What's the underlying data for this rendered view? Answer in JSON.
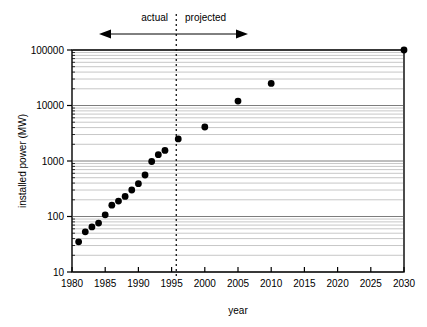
{
  "chart_data": {
    "type": "scatter",
    "title": "",
    "xlabel": "year",
    "ylabel": "installed power (MW)",
    "xlim": [
      1980,
      2030
    ],
    "ylim": [
      10,
      100000
    ],
    "yscale": "log",
    "xscale": "linear",
    "grid": "horizontal-minor-and-major",
    "legend": "none",
    "xticks": [
      "1980",
      "1985",
      "1990",
      "1995",
      "2000",
      "2005",
      "2010",
      "2015",
      "2020",
      "2025",
      "2030"
    ],
    "xtick_values": [
      1980,
      1985,
      1990,
      1995,
      2000,
      2005,
      2010,
      2015,
      2020,
      2025,
      2030
    ],
    "yticks": [
      "10",
      "100",
      "1000",
      "10000",
      "100000"
    ],
    "ytick_values": [
      10,
      100,
      1000,
      10000,
      100000
    ],
    "marker": "filled-circle",
    "marker_color": "#000000",
    "series": [
      {
        "name": "actual",
        "x": [
          1981,
          1982,
          1983,
          1984,
          1985,
          1986,
          1987,
          1988,
          1989,
          1990,
          1991,
          1992,
          1993,
          1994,
          1996
        ],
        "values": [
          35,
          53,
          65,
          76,
          107,
          160,
          190,
          230,
          300,
          390,
          560,
          980,
          1300,
          1550,
          2500
        ]
      },
      {
        "name": "projected",
        "x": [
          2000,
          2005,
          2010,
          2030
        ],
        "values": [
          4100,
          12000,
          25000,
          100000
        ]
      }
    ],
    "annotations": [
      {
        "name": "actual",
        "label": "actual",
        "side": "left"
      },
      {
        "name": "projected",
        "label": "projected",
        "side": "right"
      }
    ],
    "divider_year": 1995.7,
    "divider_style": "dotted"
  },
  "axes": {
    "y_title": "installed power (MW)",
    "x_title": "year"
  },
  "annotations": {
    "actual_label": "actual",
    "projected_label": "projected"
  },
  "ticks": {
    "x": [
      "1980",
      "1985",
      "1990",
      "1995",
      "2000",
      "2005",
      "2010",
      "2015",
      "2020",
      "2025",
      "2030"
    ],
    "y": [
      "100000",
      "10000",
      "1000",
      "100",
      "10"
    ]
  },
  "colors": {
    "marker": "#000000",
    "axis": "#000000",
    "gridline": "#9a9a9a",
    "background": "#ffffff"
  }
}
